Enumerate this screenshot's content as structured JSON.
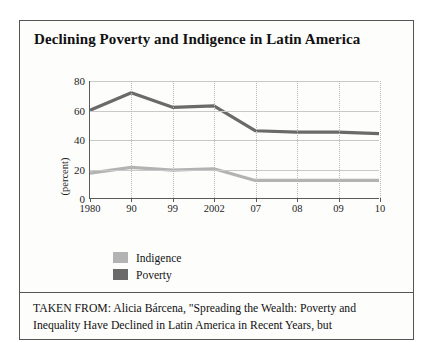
{
  "figure": {
    "title": "Declining Poverty and Indigence in Latin America",
    "caption": "TAKEN FROM: Alicia Bárcena, \"Spreading the Wealth: Poverty and Inequality Have Declined in Latin America in Recent Years, but"
  },
  "colors": {
    "poverty": "#6a6a6a",
    "indigence": "#b3b3b3",
    "axis": "#5a5a5a",
    "grid": "#c9c9c9",
    "gridDotted": "#b9b9b9",
    "border": "#555555",
    "text": "#141414"
  },
  "legend": {
    "items": [
      {
        "label": "Indigence",
        "color": "#b3b3b3"
      },
      {
        "label": "Poverty",
        "color": "#6a6a6a"
      }
    ]
  },
  "chart_data": {
    "type": "line",
    "title": "Declining Poverty and Indigence in Latin America",
    "xlabel": "",
    "ylabel": "(percent)",
    "categories": [
      "1980",
      "90",
      "99",
      "2002",
      "07",
      "08",
      "09",
      "10"
    ],
    "yticks": [
      0,
      20,
      40,
      60,
      80
    ],
    "ylim": [
      0,
      80
    ],
    "grid": true,
    "legend_position": "below-left",
    "series": [
      {
        "name": "Poverty",
        "color": "#6a6a6a",
        "values": [
          60,
          72,
          62,
          63,
          46,
          45,
          45,
          44
        ]
      },
      {
        "name": "Indigence",
        "color": "#b3b3b3",
        "values": [
          17,
          21,
          19,
          20,
          12,
          12,
          12,
          12
        ]
      }
    ]
  }
}
